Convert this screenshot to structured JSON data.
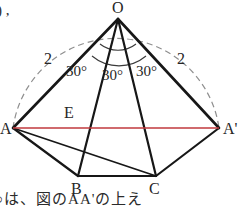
{
  "figure": {
    "name": "pyramid-unfolding-diagram",
    "vertices": {
      "apex": "O",
      "left_base": "A",
      "right_base": "A'",
      "bottom_left": "B",
      "bottom_right": "C",
      "mid_left": "E"
    },
    "edge_lengths": {
      "left": "2",
      "right": "2"
    },
    "angles": [
      "30°",
      "30°",
      "30°"
    ],
    "colors": {
      "stroke": "#1b1b1b",
      "dashed": "#8a8a8a",
      "highlight": "#c0393c",
      "background": "#ffffff"
    }
  },
  "annotations": {
    "top_left_fragment": ") ,",
    "bottom_caption": "○は、図のAA'の上え"
  }
}
